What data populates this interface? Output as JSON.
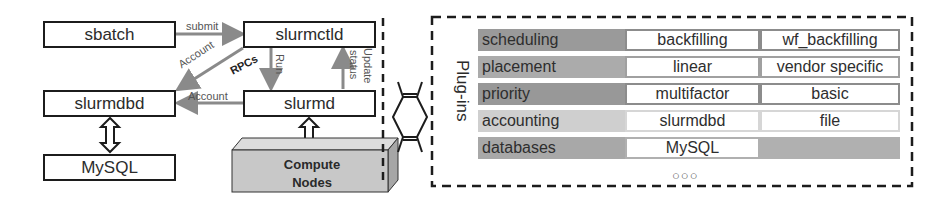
{
  "components": {
    "sbatch": "sbatch",
    "slurmctld": "slurmctld",
    "slurmdbd": "slurmdbd",
    "slurmd": "slurmd",
    "mysql": "MySQL",
    "compute_nodes_line1": "Compute",
    "compute_nodes_line2": "Nodes"
  },
  "edges": {
    "submit": "submit",
    "account_diag": "Account",
    "account_horiz": "Account",
    "rpcs": "RPCs",
    "run": "Run",
    "update": "Update",
    "status": "status"
  },
  "plugins": {
    "title": "Plug-ins",
    "rows": [
      {
        "category": "scheduling",
        "cat_color": "#9a9a9a",
        "border_color": "#8c8c8c",
        "options": [
          "backfilling",
          "wf_backfilling"
        ]
      },
      {
        "category": "placement",
        "cat_color": "#ababab",
        "border_color": "#a0a0a0",
        "options": [
          "linear",
          "vendor specific"
        ]
      },
      {
        "category": "priority",
        "cat_color": "#989898",
        "border_color": "#8c8c8c",
        "options": [
          "multifactor",
          "basic"
        ]
      },
      {
        "category": "accounting",
        "cat_color": "#cfcfcf",
        "border_color": "#d0d0d0",
        "options": [
          "slurmdbd",
          "file"
        ]
      },
      {
        "category": "databases",
        "cat_color": "#a8a8a8",
        "border_color": "#b0b0b0",
        "options": [
          "MySQL",
          ""
        ]
      }
    ],
    "more": "○○○"
  }
}
